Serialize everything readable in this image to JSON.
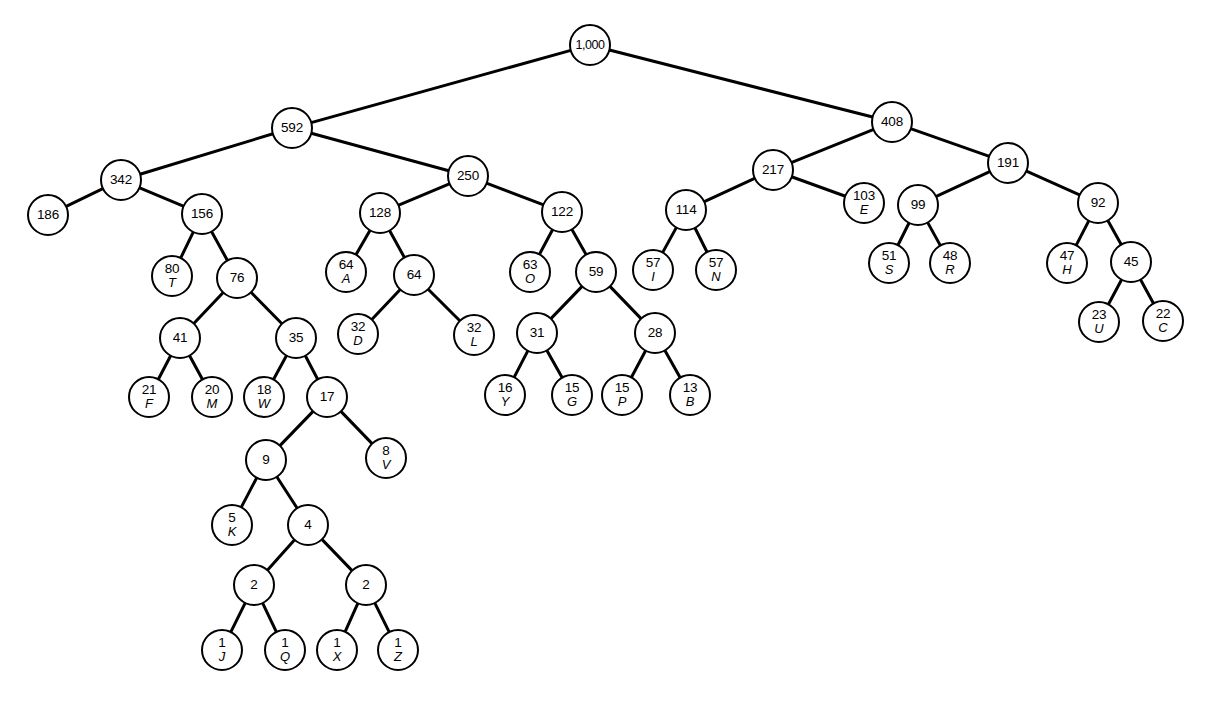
{
  "figure": {
    "type": "huffman-binary-tree",
    "background_color": "#ffffff",
    "node_color": "#ffffff",
    "stroke_color": "#000000",
    "width": 1205,
    "height": 702,
    "node_radius": 21,
    "leaf_count": 26,
    "root_weight": "1,000"
  },
  "nodes": [
    {
      "id": "n0",
      "weight": "1,000",
      "symbol": "",
      "x": 590,
      "y": 45,
      "r": 21
    },
    {
      "id": "n1",
      "weight": "592",
      "symbol": "",
      "x": 292,
      "y": 128,
      "r": 21
    },
    {
      "id": "n2",
      "weight": "408",
      "symbol": "",
      "x": 892,
      "y": 122,
      "r": 21
    },
    {
      "id": "n3",
      "weight": "342",
      "symbol": "",
      "x": 121,
      "y": 180,
      "r": 21
    },
    {
      "id": "n4",
      "weight": "250",
      "symbol": "",
      "x": 468,
      "y": 176,
      "r": 21
    },
    {
      "id": "n5",
      "weight": "186",
      "symbol": "",
      "x": 48,
      "y": 215,
      "r": 21
    },
    {
      "id": "n6",
      "weight": "156",
      "symbol": "",
      "x": 202,
      "y": 214,
      "r": 21
    },
    {
      "id": "n7",
      "weight": "128",
      "symbol": "",
      "x": 380,
      "y": 213,
      "r": 21
    },
    {
      "id": "n8",
      "weight": "122",
      "symbol": "",
      "x": 562,
      "y": 212,
      "r": 21
    },
    {
      "id": "n9",
      "weight": "217",
      "symbol": "",
      "x": 773,
      "y": 170,
      "r": 21
    },
    {
      "id": "n10",
      "weight": "191",
      "symbol": "",
      "x": 1008,
      "y": 163,
      "r": 21
    },
    {
      "id": "n11",
      "weight": "114",
      "symbol": "",
      "x": 686,
      "y": 210,
      "r": 21
    },
    {
      "id": "n12",
      "weight": "103",
      "symbol": "E",
      "x": 864,
      "y": 203,
      "r": 21
    },
    {
      "id": "n13",
      "weight": "99",
      "symbol": "",
      "x": 918,
      "y": 205,
      "r": 21
    },
    {
      "id": "n14",
      "weight": "92",
      "symbol": "",
      "x": 1098,
      "y": 203,
      "r": 21
    },
    {
      "id": "n15",
      "weight": "80",
      "symbol": "T",
      "x": 172,
      "y": 276,
      "r": 21
    },
    {
      "id": "n16",
      "weight": "76",
      "symbol": "",
      "x": 237,
      "y": 278,
      "r": 21
    },
    {
      "id": "n17",
      "weight": "64",
      "symbol": "A",
      "x": 346,
      "y": 272,
      "r": 21
    },
    {
      "id": "n18",
      "weight": "64",
      "symbol": "",
      "x": 414,
      "y": 275,
      "r": 21
    },
    {
      "id": "n19",
      "weight": "63",
      "symbol": "O",
      "x": 530,
      "y": 272,
      "r": 21
    },
    {
      "id": "n20",
      "weight": "59",
      "symbol": "",
      "x": 596,
      "y": 272,
      "r": 21
    },
    {
      "id": "n21",
      "weight": "57",
      "symbol": "I",
      "x": 653,
      "y": 270,
      "r": 21
    },
    {
      "id": "n22",
      "weight": "57",
      "symbol": "N",
      "x": 716,
      "y": 270,
      "r": 21
    },
    {
      "id": "n23",
      "weight": "51",
      "symbol": "S",
      "x": 889,
      "y": 263,
      "r": 21
    },
    {
      "id": "n24",
      "weight": "48",
      "symbol": "R",
      "x": 950,
      "y": 263,
      "r": 21
    },
    {
      "id": "n25",
      "weight": "47",
      "symbol": "H",
      "x": 1067,
      "y": 263,
      "r": 21
    },
    {
      "id": "n26",
      "weight": "45",
      "symbol": "",
      "x": 1131,
      "y": 262,
      "r": 21
    },
    {
      "id": "n27",
      "weight": "41",
      "symbol": "",
      "x": 180,
      "y": 338,
      "r": 21
    },
    {
      "id": "n28",
      "weight": "35",
      "symbol": "",
      "x": 296,
      "y": 338,
      "r": 21
    },
    {
      "id": "n29",
      "weight": "32",
      "symbol": "D",
      "x": 358,
      "y": 334,
      "r": 21
    },
    {
      "id": "n30",
      "weight": "32",
      "symbol": "L",
      "x": 474,
      "y": 335,
      "r": 21
    },
    {
      "id": "n31",
      "weight": "31",
      "symbol": "",
      "x": 537,
      "y": 333,
      "r": 21
    },
    {
      "id": "n32",
      "weight": "28",
      "symbol": "",
      "x": 655,
      "y": 333,
      "r": 21
    },
    {
      "id": "n33",
      "weight": "23",
      "symbol": "U",
      "x": 1099,
      "y": 322,
      "r": 21
    },
    {
      "id": "n34",
      "weight": "22",
      "symbol": "C",
      "x": 1163,
      "y": 321,
      "r": 21
    },
    {
      "id": "n35",
      "weight": "21",
      "symbol": "F",
      "x": 149,
      "y": 397,
      "r": 21
    },
    {
      "id": "n36",
      "weight": "20",
      "symbol": "M",
      "x": 212,
      "y": 397,
      "r": 21
    },
    {
      "id": "n37",
      "weight": "18",
      "symbol": "W",
      "x": 264,
      "y": 397,
      "r": 21
    },
    {
      "id": "n38",
      "weight": "17",
      "symbol": "",
      "x": 327,
      "y": 397,
      "r": 21
    },
    {
      "id": "n39",
      "weight": "16",
      "symbol": "Y",
      "x": 505,
      "y": 395,
      "r": 21
    },
    {
      "id": "n40",
      "weight": "15",
      "symbol": "G",
      "x": 572,
      "y": 395,
      "r": 21
    },
    {
      "id": "n41",
      "weight": "15",
      "symbol": "P",
      "x": 622,
      "y": 395,
      "r": 21
    },
    {
      "id": "n42",
      "weight": "13",
      "symbol": "B",
      "x": 690,
      "y": 395,
      "r": 21
    },
    {
      "id": "n43",
      "weight": "9",
      "symbol": "",
      "x": 266,
      "y": 460,
      "r": 21
    },
    {
      "id": "n44",
      "weight": "8",
      "symbol": "V",
      "x": 386,
      "y": 458,
      "r": 21
    },
    {
      "id": "n45",
      "weight": "5",
      "symbol": "K",
      "x": 232,
      "y": 525,
      "r": 21
    },
    {
      "id": "n46",
      "weight": "4",
      "symbol": "",
      "x": 308,
      "y": 525,
      "r": 21
    },
    {
      "id": "n47",
      "weight": "2",
      "symbol": "",
      "x": 254,
      "y": 585,
      "r": 21
    },
    {
      "id": "n48",
      "weight": "2",
      "symbol": "",
      "x": 366,
      "y": 585,
      "r": 21
    },
    {
      "id": "n49",
      "weight": "1",
      "symbol": "J",
      "x": 222,
      "y": 650,
      "r": 21
    },
    {
      "id": "n50",
      "weight": "1",
      "symbol": "Q",
      "x": 285,
      "y": 650,
      "r": 21
    },
    {
      "id": "n51",
      "weight": "1",
      "symbol": "X",
      "x": 337,
      "y": 650,
      "r": 21
    },
    {
      "id": "n52",
      "weight": "1",
      "symbol": "Z",
      "x": 398,
      "y": 650,
      "r": 21
    }
  ],
  "edges": [
    {
      "from": "n0",
      "to": "n1"
    },
    {
      "from": "n0",
      "to": "n2"
    },
    {
      "from": "n1",
      "to": "n3"
    },
    {
      "from": "n1",
      "to": "n4"
    },
    {
      "from": "n3",
      "to": "n5"
    },
    {
      "from": "n3",
      "to": "n6"
    },
    {
      "from": "n6",
      "to": "n15"
    },
    {
      "from": "n6",
      "to": "n16"
    },
    {
      "from": "n16",
      "to": "n27"
    },
    {
      "from": "n16",
      "to": "n28"
    },
    {
      "from": "n27",
      "to": "n35"
    },
    {
      "from": "n27",
      "to": "n36"
    },
    {
      "from": "n28",
      "to": "n37"
    },
    {
      "from": "n28",
      "to": "n38"
    },
    {
      "from": "n38",
      "to": "n43"
    },
    {
      "from": "n38",
      "to": "n44"
    },
    {
      "from": "n43",
      "to": "n45"
    },
    {
      "from": "n43",
      "to": "n46"
    },
    {
      "from": "n46",
      "to": "n47"
    },
    {
      "from": "n46",
      "to": "n48"
    },
    {
      "from": "n47",
      "to": "n49"
    },
    {
      "from": "n47",
      "to": "n50"
    },
    {
      "from": "n48",
      "to": "n51"
    },
    {
      "from": "n48",
      "to": "n52"
    },
    {
      "from": "n4",
      "to": "n7"
    },
    {
      "from": "n4",
      "to": "n8"
    },
    {
      "from": "n7",
      "to": "n17"
    },
    {
      "from": "n7",
      "to": "n18"
    },
    {
      "from": "n18",
      "to": "n29"
    },
    {
      "from": "n18",
      "to": "n30"
    },
    {
      "from": "n8",
      "to": "n19"
    },
    {
      "from": "n8",
      "to": "n20"
    },
    {
      "from": "n20",
      "to": "n31"
    },
    {
      "from": "n20",
      "to": "n32"
    },
    {
      "from": "n31",
      "to": "n39"
    },
    {
      "from": "n31",
      "to": "n40"
    },
    {
      "from": "n32",
      "to": "n41"
    },
    {
      "from": "n32",
      "to": "n42"
    },
    {
      "from": "n2",
      "to": "n9"
    },
    {
      "from": "n2",
      "to": "n10"
    },
    {
      "from": "n9",
      "to": "n11"
    },
    {
      "from": "n9",
      "to": "n12"
    },
    {
      "from": "n11",
      "to": "n21"
    },
    {
      "from": "n11",
      "to": "n22"
    },
    {
      "from": "n10",
      "to": "n13"
    },
    {
      "from": "n10",
      "to": "n14"
    },
    {
      "from": "n13",
      "to": "n23"
    },
    {
      "from": "n13",
      "to": "n24"
    },
    {
      "from": "n14",
      "to": "n25"
    },
    {
      "from": "n14",
      "to": "n26"
    },
    {
      "from": "n26",
      "to": "n33"
    },
    {
      "from": "n26",
      "to": "n34"
    }
  ]
}
